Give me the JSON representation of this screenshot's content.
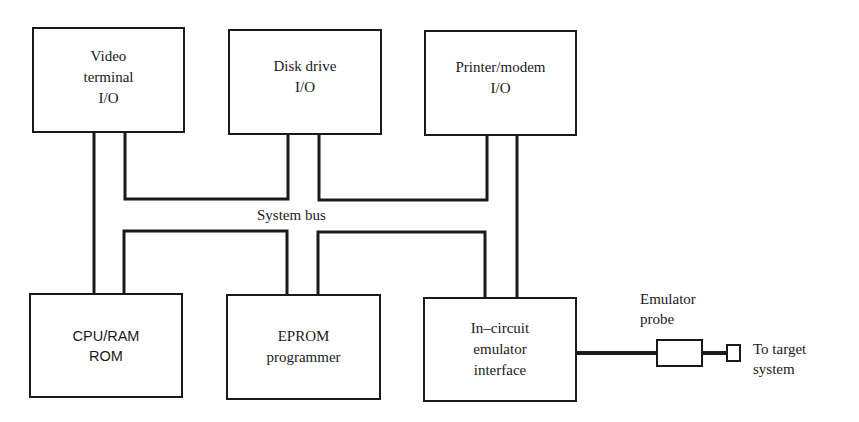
{
  "diagram": {
    "type": "block-diagram",
    "bus_label": "System bus",
    "top_row": [
      {
        "id": "video",
        "label": "Video\nterminal\nI/O"
      },
      {
        "id": "disk",
        "label": "Disk drive\nI/O"
      },
      {
        "id": "printer",
        "label": "Printer/modem\nI/O"
      }
    ],
    "bottom_row": [
      {
        "id": "cpu",
        "label": "CPU/RAM\nROM"
      },
      {
        "id": "eprom",
        "label": "EPROM\nprogrammer"
      },
      {
        "id": "ice",
        "label": "In–circuit\nemulator\ninterface"
      }
    ],
    "probe": {
      "label": "Emulator\nprobe",
      "target_label": "To target\nsystem"
    },
    "colors": {
      "line": "#1a1a1a",
      "background": "#ffffff"
    }
  }
}
